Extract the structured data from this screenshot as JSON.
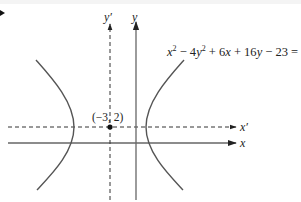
{
  "diagram": {
    "type": "conic-section-hyperbola",
    "equation": {
      "text": "x² − 4y² + 6x + 16y − 23 = 0",
      "parts": {
        "t1_var": "x",
        "t1_exp": "2",
        "op1": " − 4",
        "t2_var": "y",
        "t2_exp": "2",
        "op2": " + 6",
        "t3_var": "x",
        "op3": " + 16",
        "t4_var": "y",
        "rest": " − 23 = 0"
      }
    },
    "center_point": {
      "label": "(−3, 2)",
      "x": -3,
      "y": 2
    },
    "axes": {
      "x_label": "x",
      "y_label": "y",
      "x_prime_label": "x′",
      "y_prime_label": "y′"
    },
    "styles": {
      "curve_color": "#555555",
      "axis_color": "#666666",
      "dashed_color": "#333333",
      "text_color": "#222222",
      "point_color": "#111111"
    }
  }
}
